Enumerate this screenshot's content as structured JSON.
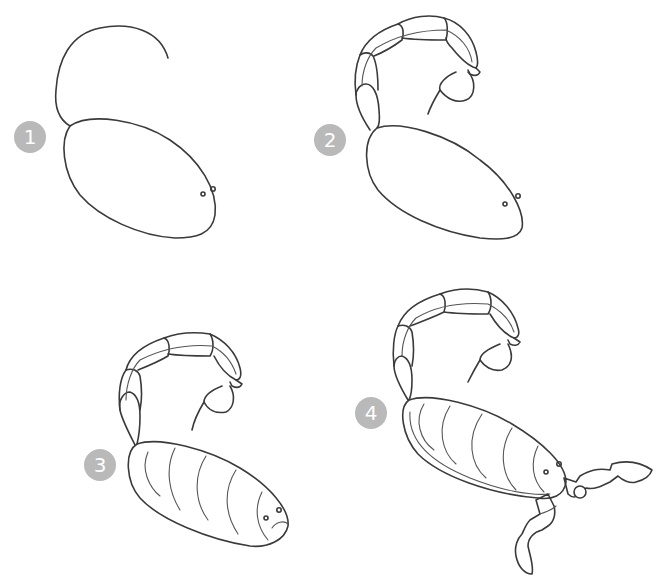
{
  "tutorial": {
    "subject": "scorpion",
    "steps": [
      {
        "number": "1",
        "description": "Body oval with curved tail guide line"
      },
      {
        "number": "2",
        "description": "Segmented tail with stinger"
      },
      {
        "number": "3",
        "description": "Body segments and head details"
      },
      {
        "number": "4",
        "description": "Pincers and claws added"
      }
    ]
  },
  "colors": {
    "badge_bg": "#b9b9b9",
    "badge_text": "#ffffff",
    "stroke": "#3a3a3a",
    "background": "#ffffff"
  }
}
